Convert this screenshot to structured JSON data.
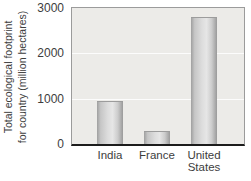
{
  "chart_data": {
    "type": "bar",
    "categories": [
      "India",
      "France",
      "United States"
    ],
    "values": [
      950,
      290,
      2810
    ],
    "title": "",
    "xlabel": "",
    "ylabel": "Total ecological footprint for country (million hectares)",
    "ylabel_lines": [
      "Total ecological footprint",
      "for country (million hectares)"
    ],
    "ylim": [
      0,
      3000
    ],
    "yticks": [
      0,
      1000,
      2000,
      3000
    ],
    "grid": "faint white horizontal gridlines at 1000 and 2000",
    "legend": "none",
    "colors": {
      "plot_bg": "#ECEBE8",
      "plot_border": "#9B9B9B",
      "axis_line": "#1C1C1C",
      "gridline": "#FFFFFF",
      "bar_edge": "#9F9F9F",
      "bar_mid": "#E4E4E4",
      "text": "#3D3D3D"
    }
  }
}
